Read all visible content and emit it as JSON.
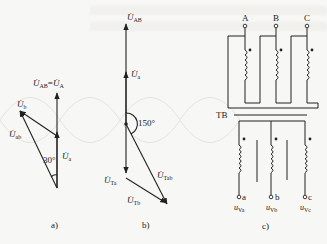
{
  "figure": {
    "panels": [
      {
        "id": "a",
        "caption": "a)",
        "title_label": {
          "main": "U",
          "sub": "AB",
          "eq": "=",
          "main2": "U",
          "sub2": "A"
        },
        "phasors": [
          {
            "name": "U_AB = U_A",
            "main": "U",
            "sub": "AB"
          },
          {
            "name": "U_a",
            "main": "U",
            "sub": "a"
          },
          {
            "name": "U_b",
            "main": "U",
            "sub": "b"
          },
          {
            "name": "U_ab",
            "main": "U",
            "sub": "ab"
          }
        ],
        "angle_label": "30°"
      },
      {
        "id": "b",
        "caption": "b)",
        "phasors": [
          {
            "name": "U_AB",
            "main": "U",
            "sub": "AB"
          },
          {
            "name": "U_a",
            "main": "U",
            "sub": "a"
          },
          {
            "name": "U_Ta",
            "main": "U",
            "sub": "Ta"
          },
          {
            "name": "U_Tb",
            "main": "U",
            "sub": "Tb"
          },
          {
            "name": "U_Tab",
            "main": "U",
            "sub": "Tab"
          }
        ],
        "angle_label": "150°"
      },
      {
        "id": "c",
        "caption": "c)",
        "primary_terminals": [
          "A",
          "B",
          "C"
        ],
        "transformer_label": "TB",
        "secondary_terminals": [
          "a",
          "b",
          "c"
        ],
        "secondary_voltages": [
          {
            "main": "u",
            "sub": "Va"
          },
          {
            "main": "u",
            "sub": "Vb"
          },
          {
            "main": "u",
            "sub": "Vc"
          }
        ]
      }
    ]
  }
}
